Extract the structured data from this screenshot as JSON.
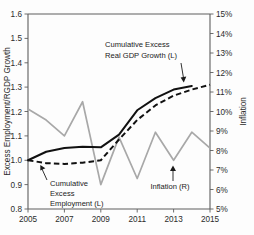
{
  "chart_data": {
    "type": "line",
    "title": "",
    "xlabel": "",
    "ylabel": "Excess Employment/RGDP Growth",
    "y2label": "Inflation",
    "xlim": [
      2005,
      2015
    ],
    "ylim": [
      0.8,
      1.6
    ],
    "y2lim": [
      5,
      15
    ],
    "grid": false,
    "legend_position": "inline-annotations",
    "x_ticks": [
      "2005",
      "2007",
      "2009",
      "2011",
      "2013",
      "2015"
    ],
    "y_ticks": [
      "0.8",
      "0.9",
      "1.0",
      "1.1",
      "1.2",
      "1.3",
      "1.4",
      "1.5",
      "1.6"
    ],
    "y2_ticks": [
      "5%",
      "6%",
      "7%",
      "8%",
      "9%",
      "10%",
      "11%",
      "12%",
      "13%",
      "14%",
      "15%"
    ],
    "x": [
      2005,
      2006,
      2007,
      2008,
      2009,
      2010,
      2011,
      2012,
      2013,
      2014,
      2015
    ],
    "series": [
      {
        "name": "Cumulative Excess Real GDP Growth (L)",
        "axis": "left",
        "style": "solid",
        "color": "#111111",
        "x": [
          2005,
          2006,
          2007,
          2008,
          2009,
          2010,
          2011,
          2012,
          2013,
          2014
        ],
        "values": [
          1.0,
          1.035,
          1.05,
          1.055,
          1.053,
          1.105,
          1.205,
          1.255,
          1.29,
          1.305
        ]
      },
      {
        "name": "Cumulative Excess Employment (L)",
        "axis": "left",
        "style": "dashed",
        "color": "#111111",
        "x": [
          2005,
          2006,
          2007,
          2008,
          2009,
          2010,
          2011,
          2012,
          2013,
          2014,
          2015
        ],
        "values": [
          1.0,
          0.988,
          0.985,
          0.99,
          1.0,
          1.085,
          1.165,
          1.225,
          1.265,
          1.29,
          1.31
        ]
      },
      {
        "name": "Inflation (R)",
        "axis": "right",
        "style": "solid",
        "color": "#a8a8a8",
        "x": [
          2005,
          2006,
          2007,
          2008,
          2009,
          2010,
          2011,
          2012,
          2013,
          2014,
          2015
        ],
        "values_left_scale": [
          1.21,
          1.165,
          1.1,
          1.24,
          0.9,
          1.095,
          0.925,
          1.115,
          1.0,
          1.115,
          1.05
        ],
        "values": [
          10.1,
          9.6,
          8.75,
          10.5,
          6.25,
          8.7,
          6.55,
          8.95,
          7.5,
          8.95,
          8.1
        ]
      }
    ],
    "annotations": [
      {
        "id": "gdp-annotation",
        "lines": [
          "Cumulative Excess",
          "Real GDP Growth (L)"
        ],
        "arrow": "down"
      },
      {
        "id": "employment-annotation",
        "lines": [
          "Cumulative",
          "Excess",
          "Employment (L)"
        ],
        "arrow": "up-left"
      },
      {
        "id": "inflation-annotation",
        "lines": [
          "Inflation (R)"
        ],
        "arrow": "up"
      }
    ]
  },
  "colors": {
    "gdp_line": "#111111",
    "employment_line": "#111111",
    "inflation_line": "#a8a8a8",
    "axis": "#5e5e5e",
    "background": "#fdfdfd"
  }
}
